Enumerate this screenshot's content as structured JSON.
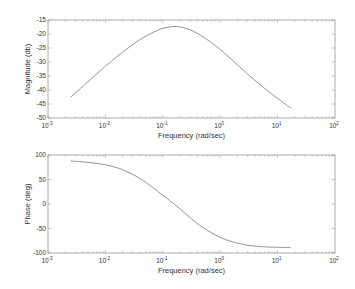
{
  "chart_data": [
    {
      "type": "line",
      "title": "",
      "xlabel": "Frequency (rad/sec)",
      "ylabel": "Magnitude (db)",
      "xscale": "log",
      "xlim": [
        0.001,
        100
      ],
      "ylim": [
        -50,
        -15
      ],
      "xticks": [
        "10^-3",
        "10^-2",
        "10^-1",
        "10^0",
        "10^1",
        "10^2"
      ],
      "yticks": [
        -15,
        -20,
        -25,
        -30,
        -35,
        -40,
        -45,
        -50
      ],
      "grid": false,
      "series": [
        {
          "name": "Magnitude",
          "x": [
            0.0025,
            0.005,
            0.01,
            0.02,
            0.04,
            0.07,
            0.1,
            0.15,
            0.2,
            0.3,
            0.5,
            1,
            2,
            4,
            8,
            17
          ],
          "values": [
            -42.5,
            -37.0,
            -31.5,
            -26.5,
            -22.0,
            -19.3,
            -18.0,
            -17.3,
            -17.5,
            -18.5,
            -21.0,
            -25.5,
            -31.0,
            -36.5,
            -41.5,
            -46.5
          ]
        }
      ]
    },
    {
      "type": "line",
      "title": "",
      "xlabel": "Frequency (rad/sec)",
      "ylabel": "Phase (deg)",
      "xscale": "log",
      "xlim": [
        0.001,
        100
      ],
      "ylim": [
        -100,
        100
      ],
      "xticks": [
        "10^-3",
        "10^-2",
        "10^-1",
        "10^0",
        "10^1",
        "10^2"
      ],
      "yticks": [
        100,
        50,
        0,
        -50,
        -100
      ],
      "grid": false,
      "series": [
        {
          "name": "Phase",
          "x": [
            0.0025,
            0.005,
            0.01,
            0.02,
            0.04,
            0.07,
            0.1,
            0.15,
            0.2,
            0.3,
            0.5,
            1,
            2,
            4,
            8,
            17
          ],
          "values": [
            88,
            85,
            80,
            70,
            52,
            32,
            18,
            2,
            -10,
            -28,
            -48,
            -68,
            -80,
            -86,
            -88,
            -89
          ]
        }
      ]
    }
  ],
  "labels": {
    "top_ylabel": "Magnitude (db)",
    "bottom_ylabel": "Phase (deg)",
    "xlabel": "Frequency (rad/sec)",
    "xtick_base": "10",
    "xtick_exps": [
      "-3",
      "-2",
      "-1",
      "0",
      "1",
      "2"
    ],
    "top_yticks": [
      "-15",
      "-20",
      "-25",
      "-30",
      "-35",
      "-40",
      "-45",
      "-50"
    ],
    "bottom_yticks": [
      "100",
      "50",
      "0",
      "-50",
      "-100"
    ]
  },
  "colors": {
    "axis": "#8a8a8a",
    "line": "#7a7a7a",
    "text": "#333333"
  }
}
